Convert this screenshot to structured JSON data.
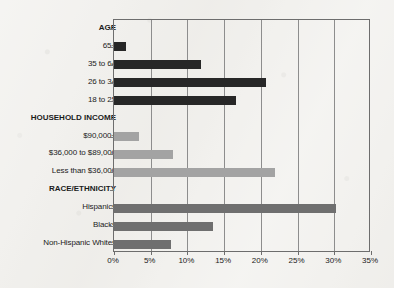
{
  "chart_data": {
    "type": "bar",
    "orientation": "horizontal",
    "title": "",
    "subtitle": "",
    "xlabel": "",
    "ylabel": "",
    "xlim": [
      0,
      35
    ],
    "xtick_labels": [
      "0%",
      "5%",
      "10%",
      "15%",
      "20%",
      "25%",
      "30%",
      "35%"
    ],
    "xtick_values": [
      0,
      5,
      10,
      15,
      20,
      25,
      30,
      35
    ],
    "grid": "vertical",
    "legend": "none",
    "value_unit": "percent",
    "groups": [
      {
        "name": "AGE",
        "color": "#272727",
        "categories": [
          "65+",
          "35 to 64",
          "26 to 34",
          "18 to 25"
        ],
        "values": [
          1.7,
          11.8,
          20.7,
          16.6
        ]
      },
      {
        "name": "HOUSEHOLD INCOME",
        "color": "#a3a3a3",
        "categories": [
          "$90,000+",
          "$36,000 to $89,000",
          "Less than $36,000"
        ],
        "values": [
          3.4,
          8.0,
          21.9
        ]
      },
      {
        "name": "RACE/ETHNICITY",
        "color": "#6f6f6f",
        "categories": [
          "Hispanics",
          "Blacks",
          "Non-Hispanic Whites"
        ],
        "values": [
          30.3,
          13.5,
          7.7
        ]
      }
    ],
    "rows": [
      {
        "label": "AGE",
        "kind": "group",
        "value": null,
        "color": null
      },
      {
        "label": "65+",
        "kind": "bar",
        "value": 1.7,
        "color": "#272727"
      },
      {
        "label": "35 to 64",
        "kind": "bar",
        "value": 11.8,
        "color": "#272727"
      },
      {
        "label": "26 to 34",
        "kind": "bar",
        "value": 20.7,
        "color": "#272727"
      },
      {
        "label": "18 to 25",
        "kind": "bar",
        "value": 16.6,
        "color": "#272727"
      },
      {
        "label": "HOUSEHOLD INCOME",
        "kind": "group",
        "value": null,
        "color": null
      },
      {
        "label": "$90,000+",
        "kind": "bar",
        "value": 3.4,
        "color": "#a3a3a3"
      },
      {
        "label": "$36,000 to $89,000",
        "kind": "bar",
        "value": 8.0,
        "color": "#a3a3a3"
      },
      {
        "label": "Less than $36,000",
        "kind": "bar",
        "value": 21.9,
        "color": "#a3a3a3"
      },
      {
        "label": "RACE/ETHNICITY",
        "kind": "group",
        "value": null,
        "color": null
      },
      {
        "label": "Hispanics",
        "kind": "bar",
        "value": 30.3,
        "color": "#6f6f6f"
      },
      {
        "label": "Blacks",
        "kind": "bar",
        "value": 13.5,
        "color": "#6f6f6f"
      },
      {
        "label": "Non-Hispanic Whites",
        "kind": "bar",
        "value": 7.7,
        "color": "#6f6f6f"
      }
    ]
  }
}
